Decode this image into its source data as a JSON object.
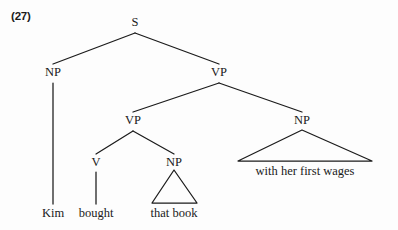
{
  "example": {
    "number_label": "(27)"
  },
  "diagram": {
    "type": "syntax-tree",
    "sentence": "Kim bought that book with her first wages",
    "ink_color": "#1b1b1b",
    "background_color": "#fdfdfd",
    "nodes": [
      {
        "id": "s",
        "label": "S",
        "x": 135,
        "y": 16,
        "anchor_y": 33
      },
      {
        "id": "np-subj",
        "label": "NP",
        "x": 53,
        "y": 66,
        "anchor_y": 83
      },
      {
        "id": "vp-top",
        "label": "VP",
        "x": 219,
        "y": 66,
        "anchor_y": 83
      },
      {
        "id": "vp-inner",
        "label": "VP",
        "x": 133,
        "y": 114,
        "anchor_y": 131
      },
      {
        "id": "np-pp",
        "label": "NP",
        "x": 302,
        "y": 114,
        "anchor_y": 131
      },
      {
        "id": "v",
        "label": "V",
        "x": 96,
        "y": 156,
        "anchor_y": 172
      },
      {
        "id": "np-obj",
        "label": "NP",
        "x": 174,
        "y": 156,
        "anchor_y": 172
      }
    ],
    "edges": [
      {
        "from": "s",
        "to": "np-subj"
      },
      {
        "from": "s",
        "to": "vp-top"
      },
      {
        "from": "vp-top",
        "to": "vp-inner"
      },
      {
        "from": "vp-top",
        "to": "np-pp"
      },
      {
        "from": "vp-inner",
        "to": "v"
      },
      {
        "from": "vp-inner",
        "to": "np-obj"
      },
      {
        "from": "np-subj",
        "to": "leaf-kim"
      },
      {
        "from": "v",
        "to": "leaf-bought"
      }
    ],
    "leaves": [
      {
        "id": "leaf-kim",
        "text": "Kim",
        "x": 53,
        "y": 207
      },
      {
        "id": "leaf-bought",
        "text": "bought",
        "x": 96,
        "y": 207
      }
    ],
    "triangles": [
      {
        "id": "tri-that-book",
        "parent": "np-obj",
        "text": "that book",
        "apex_x": 174,
        "apex_y": 170,
        "left_x": 152,
        "right_x": 197,
        "base_y": 203,
        "text_x": 174,
        "text_y": 207
      },
      {
        "id": "tri-with-her-first-wages",
        "parent": "np-pp",
        "text": "with her first wages",
        "apex_x": 302,
        "apex_y": 130,
        "left_x": 238,
        "right_x": 372,
        "base_y": 161,
        "text_x": 305,
        "text_y": 165
      }
    ]
  }
}
